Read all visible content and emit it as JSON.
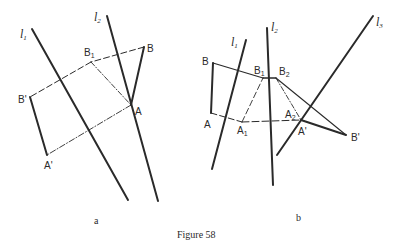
{
  "caption": "Figure 58",
  "colors": {
    "ink": "#2a2a2a",
    "background": "#ffffff"
  },
  "panels": [
    {
      "id": "a",
      "label": "a",
      "lines": [
        {
          "name": "l",
          "sub": "1"
        },
        {
          "name": "l",
          "sub": "2"
        }
      ],
      "points": {
        "B1": {
          "base": "B",
          "sub": "1"
        },
        "B": {
          "base": "B",
          "sub": ""
        },
        "A": {
          "base": "A",
          "sub": ""
        },
        "Bp": {
          "base": "B'",
          "sub": ""
        },
        "Ap": {
          "base": "A'",
          "sub": ""
        }
      }
    },
    {
      "id": "b",
      "label": "b",
      "lines": [
        {
          "name": "l",
          "sub": "1"
        },
        {
          "name": "l",
          "sub": "2"
        },
        {
          "name": "l",
          "sub": "3"
        }
      ],
      "points": {
        "B": {
          "base": "B",
          "sub": ""
        },
        "A": {
          "base": "A",
          "sub": ""
        },
        "B1": {
          "base": "B",
          "sub": "1"
        },
        "B2": {
          "base": "B",
          "sub": "2"
        },
        "A1": {
          "base": "A",
          "sub": "1"
        },
        "A2": {
          "base": "A",
          "sub": "2"
        },
        "Ap": {
          "base": "A'",
          "sub": ""
        },
        "Bp": {
          "base": "B'",
          "sub": ""
        }
      }
    }
  ]
}
